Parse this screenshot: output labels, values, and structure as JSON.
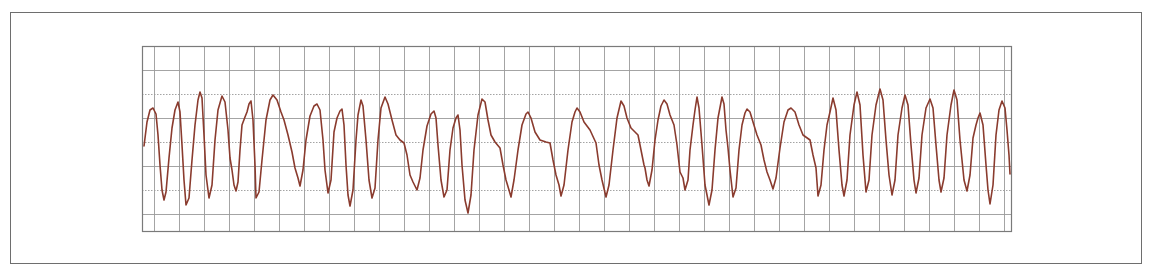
{
  "chart_data": {
    "type": "line",
    "title": "",
    "xlabel": "",
    "ylabel": "",
    "grid": true,
    "colors": {
      "trace": "#8a3b2e",
      "grid": "#9a9a9a",
      "grid_border": "#7a7a7a",
      "frame": "#6e6e6e"
    },
    "plot_area": {
      "x0": 142,
      "y0": 46,
      "x1": 1011,
      "y1": 231
    },
    "grid_vertical_x": [
      154,
      179,
      204,
      229,
      254,
      279,
      304,
      329,
      354,
      379,
      404,
      429,
      454,
      479,
      504,
      529,
      554,
      579,
      604,
      629,
      654,
      679,
      704,
      729,
      754,
      779,
      804,
      829,
      854,
      879,
      904,
      929,
      954,
      979,
      1004
    ],
    "grid_horizontal_y": [
      70,
      94,
      118,
      142,
      166,
      190,
      214
    ],
    "grid_dotted_y": [
      94,
      142,
      190
    ],
    "series": [
      {
        "name": "ECG lead",
        "points": [
          [
            144,
            146
          ],
          [
            147,
            122
          ],
          [
            150,
            110
          ],
          [
            153,
            108
          ],
          [
            156,
            114
          ],
          [
            158,
            135
          ],
          [
            160,
            165
          ],
          [
            162,
            190
          ],
          [
            164,
            200
          ],
          [
            166,
            192
          ],
          [
            169,
            158
          ],
          [
            172,
            128
          ],
          [
            175,
            110
          ],
          [
            178,
            102
          ],
          [
            180,
            112
          ],
          [
            182,
            145
          ],
          [
            184,
            180
          ],
          [
            186,
            205
          ],
          [
            189,
            198
          ],
          [
            192,
            160
          ],
          [
            195,
            125
          ],
          [
            198,
            100
          ],
          [
            200,
            92
          ],
          [
            202,
            98
          ],
          [
            204,
            135
          ],
          [
            206,
            175
          ],
          [
            209,
            198
          ],
          [
            212,
            185
          ],
          [
            215,
            140
          ],
          [
            218,
            110
          ],
          [
            222,
            96
          ],
          [
            225,
            102
          ],
          [
            228,
            130
          ],
          [
            230,
            158
          ],
          [
            232,
            170
          ],
          [
            234,
            185
          ],
          [
            236,
            191
          ],
          [
            238,
            182
          ],
          [
            240,
            150
          ],
          [
            242,
            125
          ],
          [
            245,
            117
          ],
          [
            247,
            112
          ],
          [
            249,
            104
          ],
          [
            251,
            101
          ],
          [
            253,
            120
          ],
          [
            255,
            165
          ],
          [
            256,
            198
          ],
          [
            259,
            192
          ],
          [
            262,
            160
          ],
          [
            266,
            120
          ],
          [
            270,
            100
          ],
          [
            273,
            95
          ],
          [
            277,
            100
          ],
          [
            281,
            112
          ],
          [
            284,
            120
          ],
          [
            288,
            135
          ],
          [
            292,
            152
          ],
          [
            295,
            168
          ],
          [
            298,
            178
          ],
          [
            300,
            186
          ],
          [
            303,
            170
          ],
          [
            306,
            140
          ],
          [
            310,
            116
          ],
          [
            314,
            106
          ],
          [
            317,
            104
          ],
          [
            320,
            110
          ],
          [
            323,
            140
          ],
          [
            325,
            170
          ],
          [
            328,
            193
          ],
          [
            331,
            180
          ],
          [
            334,
            132
          ],
          [
            337,
            118
          ],
          [
            340,
            111
          ],
          [
            342,
            109
          ],
          [
            344,
            125
          ],
          [
            346,
            165
          ],
          [
            348,
            195
          ],
          [
            350,
            206
          ],
          [
            353,
            190
          ],
          [
            356,
            140
          ],
          [
            358,
            115
          ],
          [
            361,
            100
          ],
          [
            363,
            106
          ],
          [
            366,
            140
          ],
          [
            369,
            180
          ],
          [
            372,
            198
          ],
          [
            375,
            188
          ],
          [
            378,
            140
          ],
          [
            381,
            108
          ],
          [
            385,
            97
          ],
          [
            388,
            104
          ],
          [
            392,
            120
          ],
          [
            396,
            135
          ],
          [
            400,
            140
          ],
          [
            404,
            143
          ],
          [
            407,
            155
          ],
          [
            410,
            175
          ],
          [
            413,
            182
          ],
          [
            417,
            190
          ],
          [
            420,
            178
          ],
          [
            423,
            150
          ],
          [
            427,
            126
          ],
          [
            431,
            114
          ],
          [
            434,
            111
          ],
          [
            436,
            118
          ],
          [
            438,
            145
          ],
          [
            441,
            180
          ],
          [
            444,
            197
          ],
          [
            447,
            190
          ],
          [
            450,
            150
          ],
          [
            453,
            128
          ],
          [
            456,
            118
          ],
          [
            458,
            115
          ],
          [
            460,
            130
          ],
          [
            462,
            165
          ],
          [
            465,
            200
          ],
          [
            468,
            213
          ],
          [
            471,
            195
          ],
          [
            474,
            150
          ],
          [
            478,
            115
          ],
          [
            482,
            99
          ],
          [
            485,
            102
          ],
          [
            488,
            120
          ],
          [
            491,
            135
          ],
          [
            495,
            142
          ],
          [
            500,
            148
          ],
          [
            503,
            165
          ],
          [
            506,
            180
          ],
          [
            509,
            190
          ],
          [
            511,
            197
          ],
          [
            514,
            180
          ],
          [
            518,
            150
          ],
          [
            522,
            125
          ],
          [
            526,
            114
          ],
          [
            528,
            112
          ],
          [
            531,
            118
          ],
          [
            535,
            132
          ],
          [
            540,
            140
          ],
          [
            546,
            142
          ],
          [
            550,
            143
          ],
          [
            553,
            160
          ],
          [
            556,
            175
          ],
          [
            559,
            185
          ],
          [
            561,
            196
          ],
          [
            564,
            185
          ],
          [
            568,
            150
          ],
          [
            572,
            122
          ],
          [
            575,
            112
          ],
          [
            577,
            108
          ],
          [
            580,
            112
          ],
          [
            584,
            122
          ],
          [
            590,
            130
          ],
          [
            596,
            143
          ],
          [
            599,
            165
          ],
          [
            602,
            180
          ],
          [
            606,
            197
          ],
          [
            609,
            185
          ],
          [
            613,
            150
          ],
          [
            617,
            118
          ],
          [
            621,
            101
          ],
          [
            624,
            106
          ],
          [
            627,
            118
          ],
          [
            631,
            128
          ],
          [
            635,
            132
          ],
          [
            638,
            135
          ],
          [
            641,
            150
          ],
          [
            644,
            165
          ],
          [
            645,
            168
          ],
          [
            647,
            180
          ],
          [
            649,
            186
          ],
          [
            652,
            170
          ],
          [
            655,
            140
          ],
          [
            658,
            120
          ],
          [
            661,
            106
          ],
          [
            664,
            100
          ],
          [
            667,
            104
          ],
          [
            670,
            115
          ],
          [
            674,
            125
          ],
          [
            677,
            145
          ],
          [
            680,
            172
          ],
          [
            683,
            178
          ],
          [
            685,
            190
          ],
          [
            688,
            180
          ],
          [
            690,
            150
          ],
          [
            693,
            125
          ],
          [
            695,
            110
          ],
          [
            697,
            97
          ],
          [
            699,
            108
          ],
          [
            702,
            145
          ],
          [
            705,
            185
          ],
          [
            709,
            205
          ],
          [
            712,
            190
          ],
          [
            715,
            150
          ],
          [
            718,
            118
          ],
          [
            722,
            97
          ],
          [
            724,
            104
          ],
          [
            726,
            130
          ],
          [
            728,
            148
          ],
          [
            730,
            170
          ],
          [
            733,
            197
          ],
          [
            736,
            188
          ],
          [
            739,
            150
          ],
          [
            742,
            125
          ],
          [
            745,
            113
          ],
          [
            747,
            109
          ],
          [
            750,
            112
          ],
          [
            753,
            122
          ],
          [
            757,
            135
          ],
          [
            761,
            145
          ],
          [
            764,
            160
          ],
          [
            767,
            172
          ],
          [
            770,
            180
          ],
          [
            773,
            189
          ],
          [
            776,
            178
          ],
          [
            780,
            148
          ],
          [
            784,
            122
          ],
          [
            788,
            110
          ],
          [
            791,
            108
          ],
          [
            795,
            112
          ],
          [
            799,
            125
          ],
          [
            803,
            135
          ],
          [
            810,
            140
          ],
          [
            813,
            155
          ],
          [
            816,
            168
          ],
          [
            818,
            196
          ],
          [
            821,
            185
          ],
          [
            824,
            150
          ],
          [
            827,
            125
          ],
          [
            830,
            112
          ],
          [
            833,
            98
          ],
          [
            836,
            110
          ],
          [
            839,
            150
          ],
          [
            842,
            185
          ],
          [
            844,
            196
          ],
          [
            847,
            180
          ],
          [
            850,
            135
          ],
          [
            854,
            105
          ],
          [
            857,
            92
          ],
          [
            860,
            105
          ],
          [
            863,
            155
          ],
          [
            866,
            192
          ],
          [
            869,
            180
          ],
          [
            872,
            135
          ],
          [
            876,
            105
          ],
          [
            880,
            89
          ],
          [
            883,
            100
          ],
          [
            886,
            140
          ],
          [
            889,
            175
          ],
          [
            892,
            195
          ],
          [
            895,
            180
          ],
          [
            898,
            135
          ],
          [
            902,
            108
          ],
          [
            905,
            95
          ],
          [
            908,
            105
          ],
          [
            911,
            145
          ],
          [
            914,
            180
          ],
          [
            916,
            193
          ],
          [
            919,
            178
          ],
          [
            922,
            135
          ],
          [
            926,
            108
          ],
          [
            930,
            99
          ],
          [
            933,
            108
          ],
          [
            936,
            145
          ],
          [
            939,
            180
          ],
          [
            941,
            192
          ],
          [
            944,
            178
          ],
          [
            947,
            135
          ],
          [
            951,
            105
          ],
          [
            954,
            90
          ],
          [
            957,
            100
          ],
          [
            960,
            140
          ],
          [
            964,
            180
          ],
          [
            967,
            191
          ],
          [
            970,
            175
          ],
          [
            973,
            138
          ],
          [
            976,
            125
          ],
          [
            978,
            118
          ],
          [
            980,
            113
          ],
          [
            983,
            125
          ],
          [
            986,
            165
          ],
          [
            988,
            190
          ],
          [
            990,
            204
          ],
          [
            993,
            185
          ],
          [
            996,
            135
          ],
          [
            999,
            110
          ],
          [
            1002,
            101
          ],
          [
            1005,
            108
          ],
          [
            1007,
            130
          ],
          [
            1009,
            155
          ],
          [
            1010,
            174
          ]
        ]
      }
    ]
  }
}
